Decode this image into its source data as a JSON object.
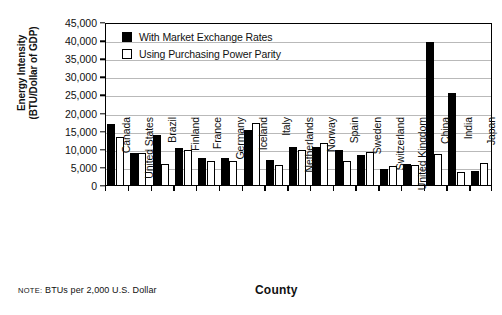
{
  "figure": {
    "y_axis_title_line1": "Energy Intensity",
    "y_axis_title_line2": "(BTU/Dollar of GDP)",
    "x_axis_title": "County",
    "note_label": "Note:",
    "note_text": "BTUs per 2,000 U.S. Dollar",
    "colors": {
      "series_market": "#000000",
      "series_ppp": "#ffffff",
      "axis": "#000000",
      "gridline": "#b9b9b9",
      "background": "#ffffff"
    }
  },
  "chart_data": {
    "type": "bar",
    "title": "",
    "subtitle": "",
    "xlabel": "County",
    "ylabel": "Energy Intensity (BTU/Dollar of GDP)",
    "ylim": [
      0,
      45000
    ],
    "ytick_labels": [
      "45,000",
      "40,000",
      "35,000",
      "30,000",
      "25,000",
      "20,000",
      "15,000",
      "10,000",
      "5,000",
      "0"
    ],
    "yticks": [
      45000,
      40000,
      35000,
      30000,
      25000,
      20000,
      15000,
      10000,
      5000,
      0
    ],
    "grid": true,
    "legend_position": "upper-left-inside",
    "annotation": "Note: BTUs per 2,000 U.S. Dollar",
    "categories": [
      "Canada",
      "United States",
      "Brazil",
      "Finland",
      "France",
      "Germany",
      "Iceland",
      "Italy",
      "Netherlands",
      "Norway",
      "Spain",
      "Sweden",
      "Switzerland",
      "United Kingdom",
      "China",
      "India",
      "Japan"
    ],
    "series": [
      {
        "name": "With Market Exchange Rates",
        "color": "#000000",
        "values": [
          17000,
          9200,
          14000,
          10400,
          7800,
          7600,
          15400,
          7200,
          10800,
          10800,
          9900,
          8700,
          4800,
          6200,
          39700,
          25700,
          4200
        ]
      },
      {
        "name": "Using Purchasing Power Parity",
        "color": "#ffffff",
        "values": [
          13600,
          9200,
          6200,
          10000,
          7000,
          6800,
          17500,
          5900,
          9900,
          11900,
          7000,
          9300,
          5600,
          5900,
          8900,
          3800,
          6300
        ]
      }
    ]
  }
}
